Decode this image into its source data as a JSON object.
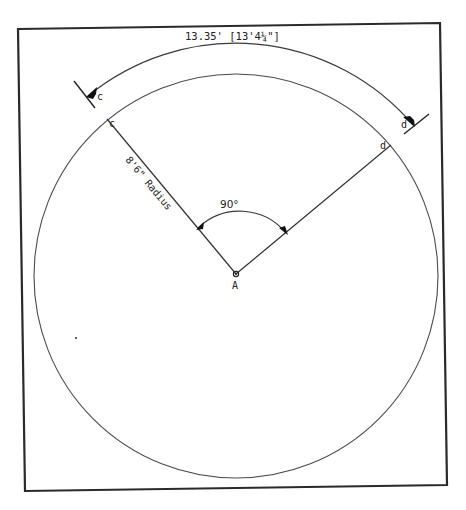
{
  "diagram": {
    "arc_length_label": "13.35' [13'4¼\"]",
    "radius_label": "8'6\" Radius",
    "angle_label": "90°",
    "center_label": "A",
    "point_labels": {
      "c_outer": "c",
      "d_outer": "d",
      "c_inner": "c",
      "d_inner": "d"
    },
    "colors": {
      "ink": "#222222",
      "background": "#ffffff"
    },
    "geometry": {
      "circle_center": [
        236,
        275
      ],
      "circle_radius": 202,
      "central_angle_deg": 90,
      "radius_feet": "8'6\"",
      "arc_length_feet": 13.35
    }
  }
}
